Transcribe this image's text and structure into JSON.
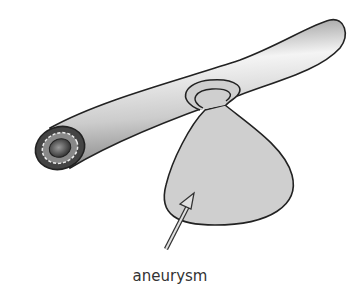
{
  "diagram": {
    "label": "aneurysm",
    "colors": {
      "vessel_light": "#f2f2f2",
      "vessel_dark": "#9a9a9a",
      "sac_fill": "#cfcfcf",
      "outline": "#222222",
      "lumen": "#555555",
      "label_text": "#333333"
    }
  }
}
